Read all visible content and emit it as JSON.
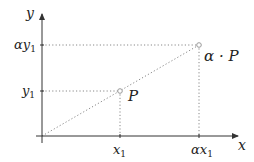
{
  "axes": {
    "x_label": "x",
    "y_label": "y",
    "color": "#333333"
  },
  "points": [
    {
      "name": "P",
      "label": "P",
      "x_tick": "x",
      "x_tick_sub": "1",
      "y_tick": "y",
      "y_tick_sub": "1"
    },
    {
      "name": "alphaP",
      "label": "α · P",
      "x_tick": "αx",
      "x_tick_sub": "1",
      "y_tick": "αy",
      "y_tick_sub": "1"
    }
  ],
  "guide_color": "#888888",
  "point_color": "#999999"
}
